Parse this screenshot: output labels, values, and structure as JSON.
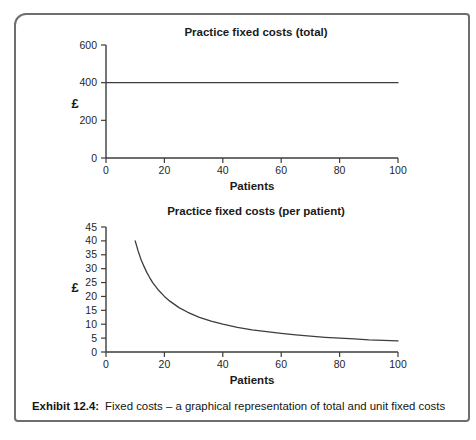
{
  "figure": {
    "caption_prefix": "Exhibit 12.4:",
    "caption_text": "Fixed costs – a graphical representation of total and unit fixed costs"
  },
  "colors": {
    "axis": "#3d3d3d",
    "line": "#3d3d3d",
    "tick_text": "#1f1f1f",
    "frame_border": "#6e6e6e",
    "background": "#ffffff"
  },
  "chart_data": [
    {
      "type": "line",
      "title": "Practice fixed costs (total)",
      "xlabel": "Patients",
      "ylabel": "£",
      "xlim": [
        0,
        100
      ],
      "ylim": [
        0,
        600
      ],
      "xticks": [
        0,
        20,
        40,
        60,
        80,
        100
      ],
      "yticks": [
        0,
        200,
        400,
        600
      ],
      "grid": false,
      "legend": "none",
      "series": [
        {
          "name": "Total fixed costs",
          "x": [
            0,
            100
          ],
          "y": [
            400,
            400
          ]
        }
      ]
    },
    {
      "type": "line",
      "title": "Practice fixed costs (per patient)",
      "xlabel": "Patients",
      "ylabel": "£",
      "xlim": [
        0,
        100
      ],
      "ylim": [
        0,
        45
      ],
      "xticks": [
        0,
        20,
        40,
        60,
        80,
        100
      ],
      "yticks": [
        0,
        5,
        10,
        15,
        20,
        25,
        30,
        35,
        40,
        45
      ],
      "grid": false,
      "legend": "none",
      "series": [
        {
          "name": "Fixed cost per patient",
          "x": [
            10,
            11,
            12,
            13,
            14,
            15,
            16,
            18,
            20,
            22,
            25,
            28,
            32,
            36,
            40,
            45,
            50,
            55,
            60,
            65,
            70,
            75,
            80,
            85,
            90,
            95,
            100
          ],
          "y": [
            40,
            36.4,
            33.3,
            30.8,
            28.6,
            26.7,
            25,
            22.2,
            20,
            18.2,
            16,
            14.3,
            12.5,
            11.1,
            10,
            8.9,
            8,
            7.3,
            6.7,
            6.2,
            5.7,
            5.3,
            5,
            4.7,
            4.4,
            4.2,
            4
          ]
        }
      ]
    }
  ]
}
